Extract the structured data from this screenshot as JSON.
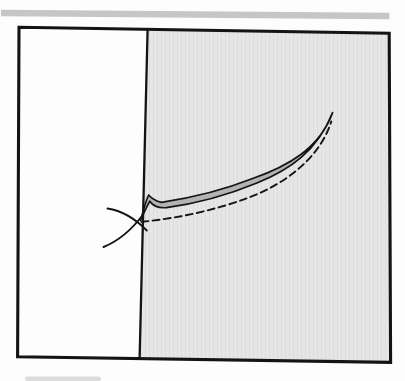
{
  "meta": {
    "kind": "scanned textbook figure"
  },
  "colors": {
    "page_bg": "#fdfdfd",
    "top_bar": "#c6c6c6",
    "ink": "#141414",
    "region_fill": "#e6e6e6",
    "region_texture": "rgba(0,0,0,0.04)",
    "band_fill": "#b3b3b3",
    "smudge": "#dcdcdc"
  },
  "elements": {
    "top_bar": "horizontal gray divider rule above the figure",
    "figure_box": "black rectangular frame, slightly skewed from scanning",
    "shaded_region": "stippled gray area right of the boundary line",
    "boundary_line": "vertical dividing line inside the frame",
    "solid_band": "narrow double solid curve with gray fill, spike at left, tip at upper right",
    "dashed_curve": "dashed convex curve from the junction to the band tip",
    "cross_tails": "two short crossing curve tails forming an X at the junction",
    "bottom_smudge": "faint gray mark at bottom-left page edge"
  }
}
